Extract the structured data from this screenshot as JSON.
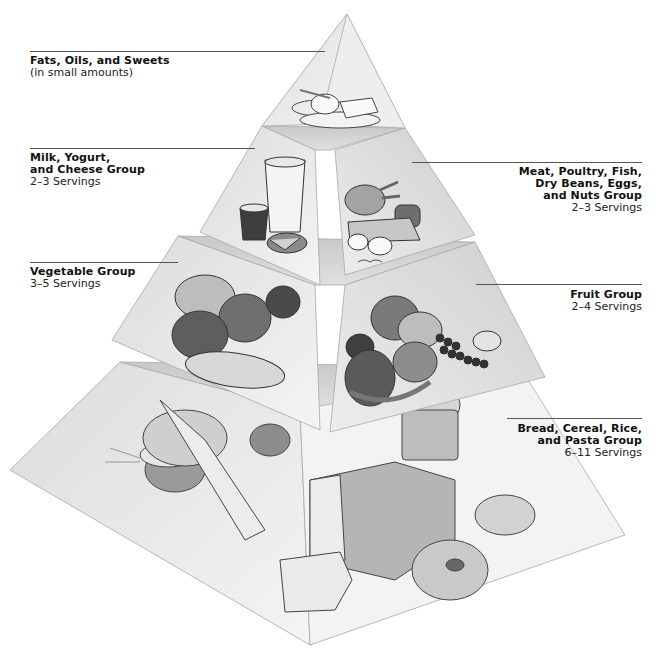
{
  "diagram": {
    "type": "food-guide-pyramid",
    "tiers": [
      {
        "id": "fats",
        "title": "Fats, Oils, and Sweets",
        "subtitle": "(in small amounts)",
        "side": "left"
      },
      {
        "id": "milk",
        "title": "Milk, Yogurt,\nand Cheese Group",
        "subtitle": "2–3 Servings",
        "side": "left"
      },
      {
        "id": "meat",
        "title": "Meat, Poultry, Fish,\nDry Beans, Eggs,\nand Nuts Group",
        "subtitle": "2–3 Servings",
        "side": "right"
      },
      {
        "id": "vegetable",
        "title": "Vegetable Group",
        "subtitle": "3–5 Servings",
        "side": "left"
      },
      {
        "id": "fruit",
        "title": "Fruit Group",
        "subtitle": "2–4 Servings",
        "side": "right"
      },
      {
        "id": "grain",
        "title": "Bread, Cereal, Rice,\nand Pasta Group",
        "subtitle": "6–11 Servings",
        "side": "right"
      }
    ],
    "foods": {
      "fats": [
        "sugar bowl",
        "spoon",
        "butter",
        "plate"
      ],
      "milk": [
        "glass of milk",
        "yogurt cup",
        "cheese wheel",
        "cheese wedge"
      ],
      "meat": [
        "chicken drumsticks",
        "steak",
        "eggs",
        "beans"
      ],
      "vegetable": [
        "cabbage",
        "peppers",
        "tomato",
        "broccoli",
        "corn",
        "pea pods"
      ],
      "fruit": [
        "apples",
        "pear",
        "grapes",
        "orange",
        "lemon",
        "banana"
      ],
      "grain": [
        "bowl of rice",
        "scoop of pasta",
        "cereal bowl",
        "bread roll",
        "loaf of bread",
        "bread slices",
        "muffin",
        "croissant",
        "bagel",
        "wheat stalks"
      ]
    },
    "colors": {
      "face_light": "#f1f1f1",
      "face_mid": "#d9d9d9",
      "face_dark": "#bdbdbd",
      "edge": "#9a9a9a",
      "text": "#111111",
      "leader": "#555555"
    }
  }
}
